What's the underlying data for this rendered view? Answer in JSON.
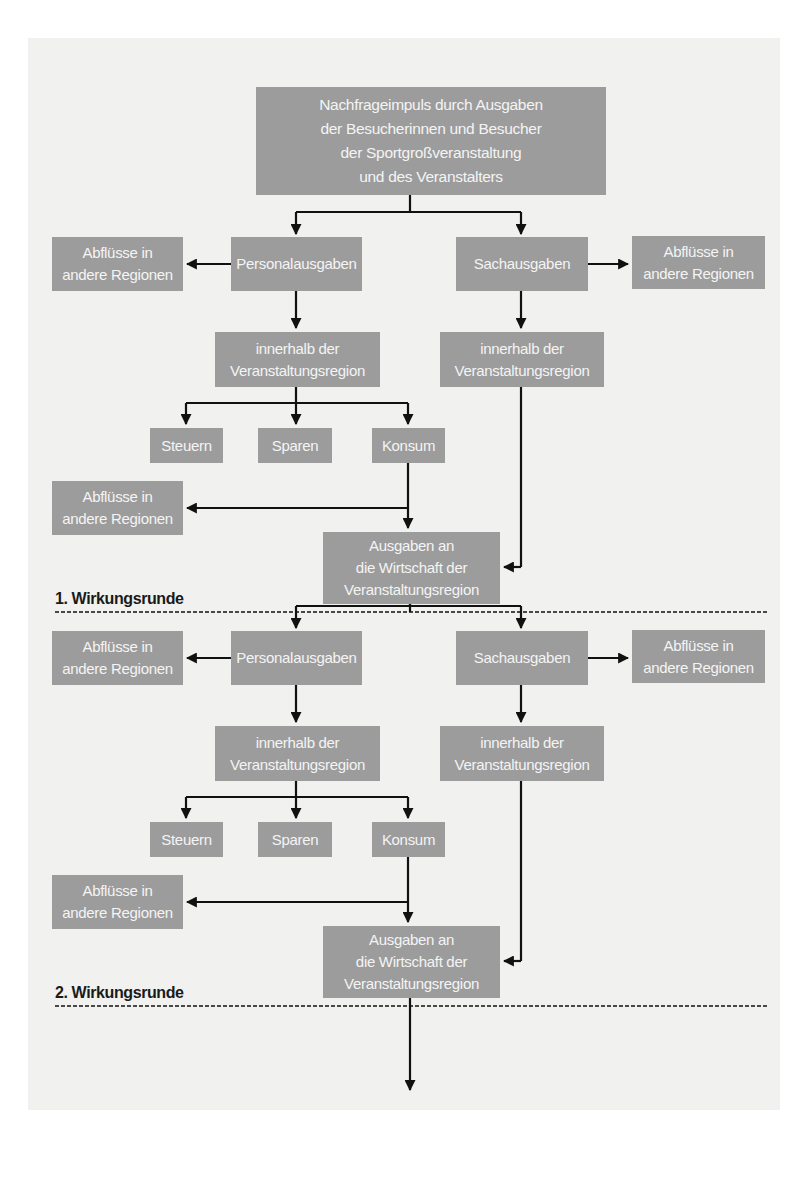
{
  "diagram": {
    "top": {
      "text": "Nachfrageimpuls durch Ausgaben\nder Besucherinnen und Besucher\nder Sportgroßveranstaltung\nund des Veranstalters"
    },
    "rounds": [
      {
        "label": "1. Wirkungsrunde",
        "personal": "Personalausgaben",
        "sach": "Sachausgaben",
        "outflow_left": "Abflüsse in\nandere Regionen",
        "outflow_right": "Abflüsse in\nandere Regionen",
        "within_left": "innerhalb der\nVeranstaltungsregion",
        "within_right": "innerhalb der\nVeranstaltungsregion",
        "taxes": "Steuern",
        "savings": "Sparen",
        "consumption": "Konsum",
        "outflow_consumption": "Abflüsse in\nandere Regionen",
        "spending_region": "Ausgaben an\ndie Wirtschaft der\nVeranstaltungsregion"
      },
      {
        "label": "2. Wirkungsrunde",
        "personal": "Personalausgaben",
        "sach": "Sachausgaben",
        "outflow_left": "Abflüsse in\nandere Regionen",
        "outflow_right": "Abflüsse in\nandere Regionen",
        "within_left": "innerhalb der\nVeranstaltungsregion",
        "within_right": "innerhalb der\nVeranstaltungsregion",
        "taxes": "Steuern",
        "savings": "Sparen",
        "consumption": "Konsum",
        "outflow_consumption": "Abflüsse in\nandere Regionen",
        "spending_region": "Ausgaben an\ndie Wirtschaft der\nVeranstaltungsregion"
      }
    ],
    "colors": {
      "box_fill": "#9c9c9c",
      "box_text": "#f4f4f4",
      "lines": "#111111",
      "page": "#f1f1ef"
    }
  }
}
